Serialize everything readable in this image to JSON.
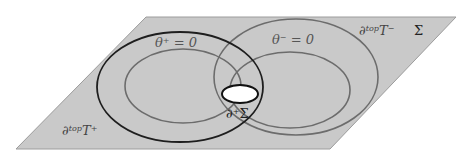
{
  "diagram": {
    "plane": {
      "name": "Sigma surface",
      "label": "Σ",
      "fill": "#c8c8c8",
      "stroke": "#9a9a9a"
    },
    "curves": {
      "dtop_T_plus": {
        "label_base": "∂",
        "label_sup": "top",
        "label_tail": "T",
        "label_tail_sup": "+",
        "color": "#1e1e1e"
      },
      "theta_plus": {
        "label_base": "θ",
        "label_sup": "+",
        "label_tail": " = 0",
        "color": "#6e6e6e"
      },
      "dtop_T_minus": {
        "label_base": "∂",
        "label_sup": "top",
        "label_tail": "T",
        "label_tail_sup": "−",
        "color": "#6e6e6e"
      },
      "theta_minus": {
        "label_base": "θ",
        "label_sup": "−",
        "label_tail": " = 0",
        "color": "#6e6e6e"
      }
    },
    "hole": {
      "label_base": "∂",
      "label_sup": "+",
      "label_tail": "Σ",
      "fill": "#ffffff",
      "stroke": "#111111"
    }
  }
}
